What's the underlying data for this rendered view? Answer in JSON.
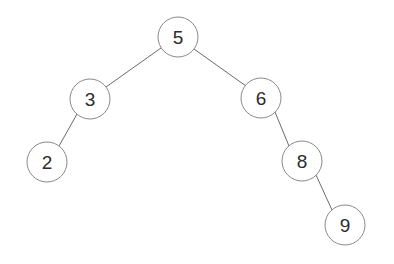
{
  "diagram": {
    "type": "binary-search-tree",
    "background_color": "#ffffff",
    "node_fill_color": "#ffffff",
    "node_stroke_color": "#8a8a8a",
    "edge_color": "#6b6b6b",
    "label_color": "#2c2c2c",
    "node_radius": 20,
    "nodes": [
      {
        "id": "n5",
        "label": "5",
        "value": 5,
        "cx": 178,
        "cy": 37,
        "r": 20,
        "role": "root",
        "depth": 0
      },
      {
        "id": "n3",
        "label": "3",
        "value": 3,
        "cx": 90,
        "cy": 99,
        "r": 20,
        "role": "left-child",
        "depth": 1
      },
      {
        "id": "n6",
        "label": "6",
        "value": 6,
        "cx": 261,
        "cy": 98,
        "r": 20,
        "role": "right-child",
        "depth": 1
      },
      {
        "id": "n2",
        "label": "2",
        "value": 2,
        "cx": 47,
        "cy": 162,
        "r": 20,
        "role": "left-child",
        "depth": 2
      },
      {
        "id": "n8",
        "label": "8",
        "value": 8,
        "cx": 302,
        "cy": 161,
        "r": 20,
        "role": "right-child",
        "depth": 2
      },
      {
        "id": "n9",
        "label": "9",
        "value": 9,
        "cx": 345,
        "cy": 225,
        "r": 20,
        "role": "right-child",
        "depth": 3
      }
    ],
    "edges": [
      {
        "id": "e5-3",
        "from": "n5",
        "to": "n3",
        "from_label": "5",
        "to_label": "3",
        "x1": 161,
        "y1": 48,
        "x2": 106,
        "y2": 87
      },
      {
        "id": "e5-6",
        "from": "n5",
        "to": "n6",
        "from_label": "5",
        "to_label": "6",
        "x1": 194,
        "y1": 49,
        "x2": 246,
        "y2": 86
      },
      {
        "id": "e3-2",
        "from": "n3",
        "to": "n2",
        "from_label": "3",
        "to_label": "2",
        "x1": 77,
        "y1": 114,
        "x2": 59,
        "y2": 146
      },
      {
        "id": "e6-8",
        "from": "n6",
        "to": "n8",
        "from_label": "6",
        "to_label": "8",
        "x1": 275,
        "y1": 112,
        "x2": 289,
        "y2": 146
      },
      {
        "id": "e8-9",
        "from": "n8",
        "to": "n9",
        "from_label": "8",
        "to_label": "9",
        "x1": 316,
        "y1": 175,
        "x2": 332,
        "y2": 210
      }
    ]
  }
}
